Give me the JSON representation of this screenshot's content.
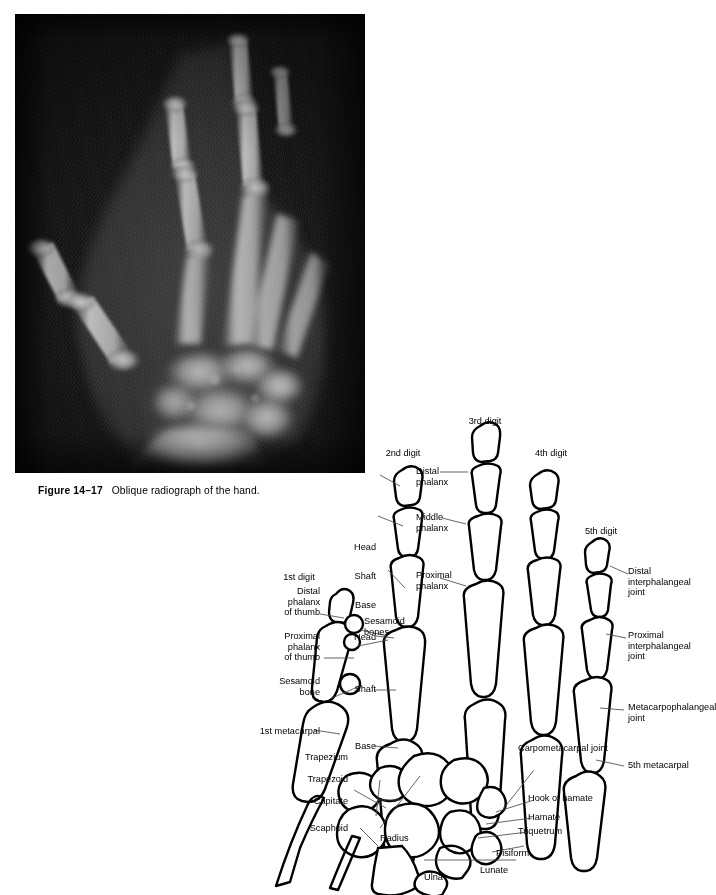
{
  "figure": {
    "number": "Figure 14–17",
    "caption": "Oblique radiograph of the hand.",
    "radiograph_alt": "oblique-hand-radiograph"
  },
  "diagram": {
    "labels": {
      "second_digit": "2nd digit",
      "third_digit": "3rd digit",
      "fourth_digit": "4th digit",
      "fifth_digit": "5th digit",
      "first_digit": "1st digit",
      "distal_phalanx": "Distal\nphalanx",
      "middle_phalanx": "Middle\nphalanx",
      "proximal_phalanx": "Proximal\nphalanx",
      "phalanx_head": "Head",
      "phalanx_shaft": "Shaft",
      "phalanx_base": "Base",
      "metacarpal_head": "Head",
      "metacarpal_shaft": "Shaft",
      "metacarpal_base": "Base",
      "distal_phalanx_of_thumb": "Distal\nphalanx\nof thumb",
      "proximal_phalanx_of_thumb": "Proximal\nphalanx\nof thumb",
      "sesamoid_bones": "Sesamoid\nbones",
      "sesamoid_bone": "Sesamoid\nbone",
      "first_metacarpal": "1st metacarpal",
      "fifth_metacarpal": "5th metacarpal",
      "distal_interphalangeal_joint": "Distal\ninterphalangeal\njoint",
      "proximal_interphalangeal_joint": "Proximal\ninterphalangeal\njoint",
      "metacarpophalangeal_joint": "Metacarpophalangeal\njoint",
      "carpometacarpal_joint": "Carpometacarpal joint",
      "hook_of_hamate": "Hook of hamate",
      "hamate": "Hamate",
      "triquetrum": "Triquetrum",
      "pisiform": "Pisiform",
      "lunate": "Lunate",
      "trapezium": "Trapezium",
      "trapezoid": "Trapezoid",
      "capitate": "Capitate",
      "scaphoid": "Scaphoid",
      "radius": "Radius",
      "ulna": "Ulna"
    }
  },
  "colors": {
    "page_background": "#ffffff",
    "ink": "#000000",
    "radiograph_background": "#0d0d0d",
    "bone_bright": "#dcdcdc",
    "leader_line": "#555555"
  }
}
